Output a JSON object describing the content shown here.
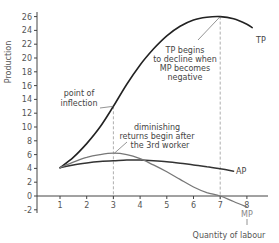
{
  "chart_data": {
    "type": "line",
    "title": "",
    "xlabel": "Quantity of labour",
    "ylabel": "Production",
    "xlim": [
      0,
      8.8
    ],
    "ylim": [
      -3,
      27
    ],
    "x_ticks": [
      1,
      2,
      3,
      4,
      5,
      6,
      7,
      8
    ],
    "y_ticks": [
      -2,
      0,
      2,
      4,
      6,
      8,
      10,
      12,
      14,
      16,
      18,
      20,
      22,
      24,
      26
    ],
    "grid": false,
    "legend": "none (inline labels at curve ends)",
    "series": [
      {
        "name": "TP",
        "color": "#222222",
        "x": [
          1,
          1.5,
          2,
          2.5,
          3,
          3.5,
          4,
          4.5,
          5,
          5.5,
          6,
          6.5,
          7,
          7.5,
          8,
          8.2
        ],
        "y": [
          4.1,
          5.6,
          7.6,
          10.0,
          13.0,
          16.2,
          19.0,
          21.3,
          23.2,
          24.6,
          25.5,
          25.9,
          26.0,
          25.7,
          24.9,
          24.4
        ]
      },
      {
        "name": "AP",
        "color": "#333333",
        "x": [
          1,
          1.5,
          2,
          2.5,
          3,
          3.5,
          4,
          4.5,
          5,
          5.5,
          6,
          6.5,
          7,
          7.5
        ],
        "y": [
          4.1,
          4.5,
          4.8,
          5.0,
          5.1,
          5.2,
          5.2,
          5.1,
          4.95,
          4.75,
          4.5,
          4.25,
          3.95,
          3.6
        ]
      },
      {
        "name": "MP",
        "color": "#777777",
        "x": [
          1,
          1.5,
          2,
          2.5,
          3,
          3.5,
          4,
          4.5,
          5,
          5.5,
          6,
          6.5,
          7,
          7.5,
          8
        ],
        "y": [
          4.1,
          4.9,
          5.6,
          6.0,
          6.2,
          6.0,
          5.4,
          4.5,
          3.5,
          2.4,
          1.3,
          0.5,
          0.0,
          -0.8,
          -1.6
        ]
      }
    ],
    "reference_lines": [
      {
        "x": 3,
        "from_y": -0.5,
        "to_y": 13.0,
        "style": "dashed",
        "meaning": "point of inflection / diminishing returns"
      },
      {
        "x": 7,
        "from_y": -0.5,
        "to_y": 26.0,
        "style": "dashed",
        "meaning": "TP maximum / MP = 0"
      }
    ],
    "annotations": [
      {
        "text": [
          "point of",
          "inflection"
        ],
        "points_to": [
          3,
          13.0
        ]
      },
      {
        "text": [
          "diminishing",
          "returns begin after",
          "the 3rd worker"
        ],
        "points_to": [
          3,
          6.2
        ]
      },
      {
        "text": [
          "TP begins",
          "to decline when",
          "MP becomes",
          "negative"
        ],
        "points_to": [
          7,
          26.0
        ]
      }
    ]
  },
  "labels": {
    "ylabel": "Production",
    "xlabel": "Quantity of labour",
    "tp": "TP",
    "ap": "AP",
    "mp": "MP",
    "inflection_1": "point of",
    "inflection_2": "inflection",
    "diminishing_1": "diminishing",
    "diminishing_2": "returns begin after",
    "diminishing_3": "the 3rd worker",
    "decline_1": "TP begins",
    "decline_2": "to decline when",
    "decline_3": "MP becomes",
    "decline_4": "negative"
  }
}
